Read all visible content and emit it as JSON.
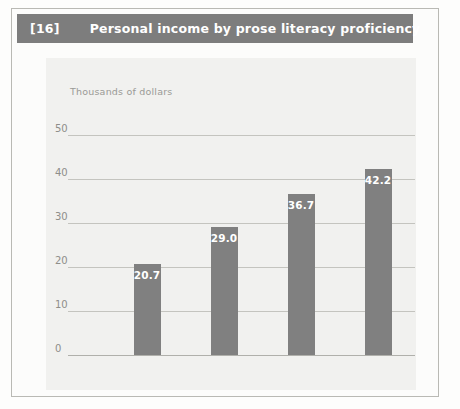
{
  "header": {
    "number": "[16]",
    "title": "Personal income by prose literacy proficiency"
  },
  "colors": {
    "header_bar": "#7d7d7d",
    "bar_fill": "#808080",
    "panel_bg": "#f1f1ef",
    "gridline": "#c4c4bf",
    "tick_text": "#8e8e8a"
  },
  "chart_data": {
    "type": "bar",
    "title": "Personal income by prose literacy proficiency",
    "ylabel": "Thousands of dollars",
    "xlabel": "",
    "categories": [
      "Poor",
      "Weak",
      "Adequate",
      "Strong"
    ],
    "category_sublabels": [
      "(Level 1)",
      "(Level 2)",
      "(Level 3)",
      "(Level 4)"
    ],
    "values": [
      20.7,
      29.0,
      36.7,
      42.2
    ],
    "data_labels": [
      "20.7",
      "29.0",
      "36.7",
      "42.2"
    ],
    "ylim": [
      0,
      50
    ],
    "yticks": [
      0,
      10,
      20,
      30,
      40,
      50
    ],
    "ytick_labels": [
      "0",
      "10",
      "20",
      "30",
      "40",
      "50"
    ],
    "grid": true,
    "legend": false
  }
}
